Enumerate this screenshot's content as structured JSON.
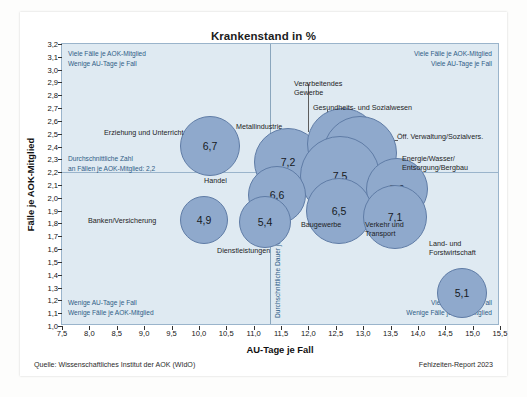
{
  "figure": {
    "title": "Krankenstand in %",
    "xlabel": "AU-Tage je Fall",
    "ylabel": "Fälle je AOK-Mitglied",
    "source": "Quelle: Wissenschaftliches Institut der AOK (WIdO)",
    "report": "Fehlzeiten-Report 2023",
    "bubble_color": "#8fa9cc",
    "bubble_stroke": "#5f7ca6",
    "plot_background": "#dfeaf2",
    "annotation_color": "#2f5d86"
  },
  "annotations": {
    "top_left": "Viele Fälle je AOK-Mitglied\nWenige AU-Tage je Fall",
    "top_right": "Viele Fälle je AOK-Mitglied\nViele AU-Tage je Fall",
    "bottom_left": "Wenige AU-Tage je Fall\nWenige Fälle je AOK-Mitglied",
    "bottom_right": "Viele AU-Tage je Fall\nWenige Fälle je AOK-Mitglied",
    "mean_y": "Durchschnittliche Zahl\nan Fällen je AOK-Mitglied: 2,2",
    "mean_x": "Durchschnittliche Dauer je Fall: 11,3 Tage"
  },
  "chart_data": {
    "type": "scatter",
    "title": "Krankenstand in %",
    "xlabel": "AU-Tage je Fall",
    "ylabel": "Fälle je AOK-Mitglied",
    "xlim": [
      7.5,
      15.5
    ],
    "ylim": [
      1.0,
      3.2
    ],
    "xticks": [
      "7,5",
      "8,0",
      "8,5",
      "9,0",
      "9,5",
      "10,0",
      "10,5",
      "11,0",
      "11,5",
      "12,0",
      "12,5",
      "13,0",
      "13,5",
      "14,0",
      "14,5",
      "15,0",
      "15,5"
    ],
    "yticks": [
      "1,0",
      "1,1",
      "1,2",
      "1,3",
      "1,4",
      "1,5",
      "1,6",
      "1,7",
      "1,8",
      "1,9",
      "2,0",
      "2,1",
      "2,2",
      "2,3",
      "2,4",
      "2,5",
      "2,6",
      "2,7",
      "2,8",
      "2,9",
      "3,0",
      "3,1",
      "3,2"
    ],
    "grid": false,
    "legend": "none",
    "reference_lines": {
      "mean_x_value": 11.3,
      "mean_y_value": 2.2
    },
    "size_meaning": "Krankenstand in % (bubble label = value)",
    "points": [
      {
        "label": "Erziehung und Unterricht",
        "x": 9.95,
        "y": 2.5,
        "value": "6,7",
        "size": 6.7
      },
      {
        "label": "Banken/Versicherung",
        "x": 9.62,
        "y": 1.91,
        "value": "4,9",
        "size": 4.9
      },
      {
        "label": "Handel",
        "x": 10.78,
        "y": 1.92,
        "value": "5,4",
        "size": 5.4
      },
      {
        "label": "Dienstleistungen",
        "x": 10.78,
        "y": 1.92,
        "value": "5,4",
        "size": 5.4
      },
      {
        "label": "Metallindustrie",
        "x": 11.24,
        "y": 2.43,
        "value": "7,2",
        "size": 7.2
      },
      {
        "label": "Handel",
        "x": 11.05,
        "y": 2.12,
        "value": "6,6",
        "size": 6.6
      },
      {
        "label": "Verarbeitendes Gewerbe",
        "x": 11.52,
        "y": 2.62,
        "value": "7,8",
        "size": 7.8
      },
      {
        "label": "Gesundheits- und Sozialwesen",
        "x": 11.85,
        "y": 2.52,
        "value": "7,9",
        "size": 7.9
      },
      {
        "label": "Öff. Verwaltung/Sozialvers.",
        "x": 11.72,
        "y": 2.33,
        "value": "7,5",
        "size": 7.5
      },
      {
        "label": "Energie/Wasser/Entsorgung/Bergbau",
        "x": 12.42,
        "y": 2.3,
        "value": "7,6",
        "size": 7.6
      },
      {
        "label": "Baugewerbe",
        "x": 11.78,
        "y": 2.02,
        "value": "6,5",
        "size": 6.5
      },
      {
        "label": "Verkehr und Transport",
        "x": 12.62,
        "y": 2.02,
        "value": "7,1",
        "size": 7.1
      },
      {
        "label": "Land- und Forstwirtschaft",
        "x": 14.05,
        "y": 1.33,
        "value": "5,1",
        "size": 5.1
      }
    ],
    "bubble_labels": [
      "6,7",
      "4,9",
      "5,4",
      "7,2",
      "6,6",
      "7,8",
      "7,9",
      "7,5",
      "7,6",
      "6,5",
      "7,1",
      "5,1"
    ],
    "category_labels": [
      "Erziehung und Unterricht",
      "Banken/Versicherung",
      "Handel",
      "Dienstleistungen",
      "Metallindustrie",
      "Verarbeitendes Gewerbe",
      "Gesundheits- und Sozialwesen",
      "Öff. Verwaltung/Sozialvers.",
      "Energie/Wasser/Entsorgung/Bergbau",
      "Baugewerbe",
      "Verkehr und Transport",
      "Land- und Forstwirtschaft"
    ]
  },
  "bubbles": [
    {
      "name": "erziehung-und-unterricht",
      "value": "6,7",
      "left": 118,
      "top": 72,
      "d": 60
    },
    {
      "name": "metallindustrie",
      "value": "7,2",
      "left": 192,
      "top": 84,
      "d": 68
    },
    {
      "name": "verarbeitendes-gewerbe",
      "value": "7,8",
      "left": 245,
      "top": 64,
      "d": 72
    },
    {
      "name": "gesundheits-sozialwesen",
      "value": "7,9",
      "left": 261,
      "top": 72,
      "d": 74
    },
    {
      "name": "oeff-verwaltung",
      "value": "7,5",
      "left": 238,
      "top": 92,
      "d": 80
    },
    {
      "name": "energie-wasser-bergbau",
      "value": "7,6",
      "left": 304,
      "top": 114,
      "d": 62
    },
    {
      "name": "handel",
      "value": "6,6",
      "left": 186,
      "top": 122,
      "d": 58
    },
    {
      "name": "baugewerbe",
      "value": "6,5",
      "left": 244,
      "top": 134,
      "d": 66
    },
    {
      "name": "verkehr-und-transport",
      "value": "7,1",
      "left": 301,
      "top": 141,
      "d": 64
    },
    {
      "name": "banken-versicherung",
      "value": "4,9",
      "left": 118,
      "top": 152,
      "d": 48
    },
    {
      "name": "dienstleistungen",
      "value": "5,4",
      "left": 177,
      "top": 152,
      "d": 52
    },
    {
      "name": "land-und-forstwirtschaft",
      "value": "5,1",
      "left": 375,
      "top": 224,
      "d": 50
    }
  ],
  "series_labels": [
    {
      "name": "erziehung-und-unterricht-label",
      "text": "Erziehung und Unterricht",
      "left": 42,
      "top": 84,
      "align": "left"
    },
    {
      "name": "metallindustrie-label",
      "text": "Metallindustrie",
      "left": 174,
      "top": 78,
      "align": "left"
    },
    {
      "name": "verarbeitendes-gewerbe-label",
      "text": "Verarbeitendes\nGewerbe",
      "left": 232,
      "top": 35,
      "align": "left"
    },
    {
      "name": "gesundheits-sozialwesen-label",
      "text": "Gesundheits- und Sozialwesen",
      "left": 251,
      "top": 59,
      "align": "left"
    },
    {
      "name": "oeff-verwaltung-label",
      "text": "Öff. Verwaltung/Sozialvers.",
      "left": 335,
      "top": 88,
      "align": "left"
    },
    {
      "name": "energie-wasser-bergbau-label",
      "text": "Energie/Wasser/\nEntsorgung/Bergbau",
      "left": 340,
      "top": 110,
      "align": "left"
    },
    {
      "name": "handel-label",
      "text": "Handel",
      "left": 142,
      "top": 132,
      "align": "left"
    },
    {
      "name": "banken-versicherung-label",
      "text": "Banken/Versicherung",
      "left": 26,
      "top": 172,
      "align": "left"
    },
    {
      "name": "dienstleistungen-label",
      "text": "Dienstleistungen",
      "left": 155,
      "top": 202,
      "align": "left"
    },
    {
      "name": "baugewerbe-label",
      "text": "Baugewerbe",
      "left": 239,
      "top": 176,
      "align": "left"
    },
    {
      "name": "verkehr-und-transport-label",
      "text": "Verkehr und\nTransport",
      "left": 303,
      "top": 176,
      "align": "left"
    },
    {
      "name": "land-forstwirtschaft-label",
      "text": "Land- und\nForstwirtschaft",
      "left": 367,
      "top": 195,
      "align": "left"
    }
  ]
}
